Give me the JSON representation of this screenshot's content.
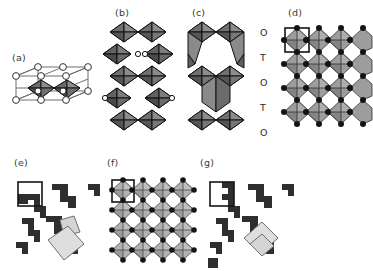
{
  "figure": {
    "background_color": "#ffffff",
    "width": 373,
    "height": 271
  },
  "palette": {
    "outline": "#111111",
    "face_light": "#d9d9d9",
    "face_mid": "#9a9a9a",
    "face_dark": "#6b6b6b",
    "face_darkest": "#4a4a4a",
    "node_fill": "#1a1a1a",
    "node_open": "#ffffff",
    "cell_box": "#1a1a1a",
    "highlight_fill": "#d8d8d8",
    "label_color": "#3a3a3a"
  },
  "panels": [
    {
      "id": "a",
      "label": "(a)",
      "label_x": 12,
      "label_y": 53,
      "caption_text": "(a)",
      "type": "unit-cell-perspective",
      "description": "Perspective unit cell outline with open circles at lattice corners and two shaded octahedra inside",
      "octahedra_count": 2,
      "open_nodes_count": 12,
      "x": 8,
      "y": 64,
      "width": 88,
      "height": 50
    },
    {
      "id": "b",
      "label": "(b)",
      "label_x": 115,
      "label_y": 10,
      "caption_text": "(b)",
      "type": "octahedral-chain",
      "description": "Vertical double column of corner and edge sharing octahedra, no interlayer gap",
      "rows": 5,
      "columns": 2,
      "x": 106,
      "y": 20,
      "width": 68,
      "height": 118
    },
    {
      "id": "c",
      "label": "(c)",
      "label_x": 192,
      "label_y": 10,
      "caption_text": "(c)",
      "type": "octahedral-tetrahedral-stack",
      "description": "Vertical stack alternating octahedral and tetrahedral slabs with open interlayer space",
      "x": 186,
      "y": 20,
      "width": 62,
      "height": 118,
      "layer_labels": [
        "O",
        "T",
        "O",
        "T",
        "O"
      ],
      "layer_label_x": 260,
      "layer_label_ys": [
        32,
        57,
        82,
        107,
        132
      ]
    },
    {
      "id": "d",
      "label": "(d)",
      "label_x": 288,
      "label_y": 10,
      "caption_text": "(d)",
      "type": "octahedral-sheet-plan",
      "description": "Plan view of a 4x4 sheet of edge sharing octahedra with filled vertex nodes and a marked unit cell",
      "grid_cols": 4,
      "grid_rows": 4,
      "unit_cell_marked": true,
      "x": 282,
      "y": 26,
      "width": 88,
      "height": 104
    },
    {
      "id": "e",
      "label": "(e)",
      "label_x": 14,
      "label_y": 160,
      "caption_text": "(e)",
      "type": "zigzag-motif",
      "description": "Dark staircase zigzag ribbons with an outlined unit cell square and a light grey rotated square highlight",
      "unit_cell_marked": true,
      "highlight_square": true,
      "x": 12,
      "y": 172,
      "width": 90,
      "height": 96
    },
    {
      "id": "f",
      "label": "(f)",
      "label_x": 107,
      "label_y": 160,
      "caption_text": "(f)",
      "type": "octahedral-sheet-plan",
      "description": "Plan view of a 4x4 sheet of lighter octahedra with filled vertex nodes and a marked unit cell",
      "grid_cols": 4,
      "grid_rows": 4,
      "unit_cell_marked": true,
      "x": 110,
      "y": 180,
      "width": 86,
      "height": 88
    },
    {
      "id": "g",
      "label": "(g)",
      "label_x": 200,
      "label_y": 160,
      "caption_text": "(g)",
      "type": "zigzag-motif",
      "description": "Dark staircase zigzag ribbons with outlined unit cell square and light grey rotated square highlight",
      "unit_cell_marked": true,
      "highlight_square": true,
      "x": 204,
      "y": 172,
      "width": 92,
      "height": 96
    }
  ]
}
